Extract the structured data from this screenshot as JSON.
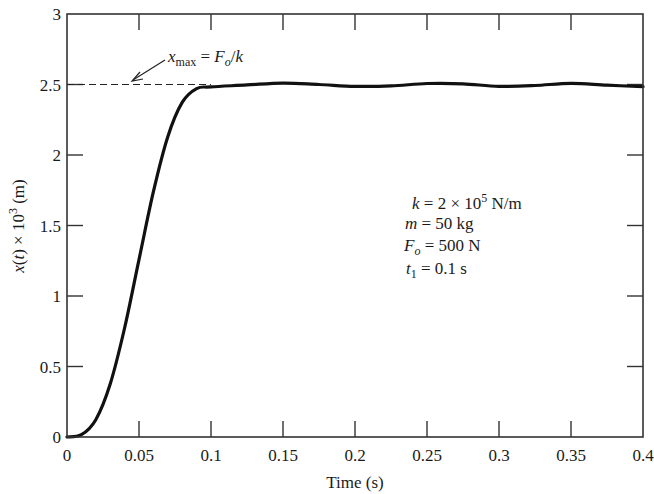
{
  "chart_data": {
    "type": "line",
    "title": "",
    "xlabel": "Time (s)",
    "ylabel": "x(t) × 10^3 (m)",
    "xlim": [
      0,
      0.4
    ],
    "ylim": [
      0,
      3
    ],
    "grid": false,
    "x_ticks": [
      0,
      0.05,
      0.1,
      0.15,
      0.2,
      0.25,
      0.3,
      0.35,
      0.4
    ],
    "x_tick_labels": [
      "0",
      "0.05",
      "0.1",
      "0.15",
      "0.2",
      "0.25",
      "0.3",
      "0.35",
      "0.4"
    ],
    "y_ticks": [
      0,
      0.5,
      1,
      1.5,
      2,
      2.5,
      3
    ],
    "y_tick_labels": [
      "0",
      "0.5",
      "1",
      "1.5",
      "2",
      "2.5",
      "3"
    ],
    "series": [
      {
        "name": "x(t)",
        "style": "solid",
        "x": [
          0,
          0.01,
          0.02,
          0.03,
          0.04,
          0.05,
          0.06,
          0.07,
          0.08,
          0.09,
          0.1,
          0.125,
          0.15,
          0.175,
          0.2,
          0.225,
          0.25,
          0.275,
          0.3,
          0.325,
          0.35,
          0.375,
          0.4
        ],
        "values": [
          0,
          0.016,
          0.123,
          0.376,
          0.773,
          1.258,
          1.74,
          2.13,
          2.373,
          2.471,
          2.483,
          2.497,
          2.51,
          2.5,
          2.487,
          2.49,
          2.507,
          2.505,
          2.487,
          2.493,
          2.508,
          2.495,
          2.485
        ]
      },
      {
        "name": "x_max = F_o/k",
        "style": "dashed",
        "x": [
          0,
          0.1
        ],
        "values": [
          2.5,
          2.5
        ]
      }
    ],
    "annotations": [
      {
        "text": "x_max = F_o/k",
        "arrow_to": [
          0.045,
          2.5
        ]
      },
      {
        "text": "k = 2 × 10^5 N/m"
      },
      {
        "text": "m = 50 kg"
      },
      {
        "text": "F_o = 500 N"
      },
      {
        "text": "t_1 = 0.1 s"
      }
    ]
  },
  "labels": {
    "xlabel": "Time (s)",
    "ylabel_var": "x",
    "ylabel_arg": "t",
    "ylabel_rest": ") × 10",
    "ylabel_exp": "3",
    "ylabel_unit": " (m)",
    "annot_x": "x",
    "annot_max": "max",
    "annot_eq": " = ",
    "annot_F": "F",
    "annot_o": "o",
    "annot_slash": "/",
    "annot_k": "k",
    "param_k_var": "k",
    "param_k_val": " = 2 × 10",
    "param_k_exp": "5",
    "param_k_unit": " N/m",
    "param_m_var": "m",
    "param_m_val": " = 50 kg",
    "param_F_var": "F",
    "param_F_sub": "o",
    "param_F_val": " = 500 N",
    "param_t_var": "t",
    "param_t_sub": "1",
    "param_t_val": " = 0.1 s"
  }
}
